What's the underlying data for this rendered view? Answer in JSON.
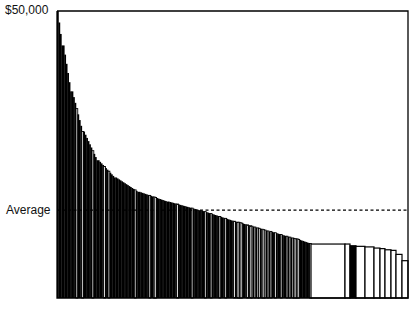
{
  "chart_data": {
    "type": "bar",
    "title": "",
    "xlabel": "",
    "ylabel": "",
    "ylim": [
      0,
      50000
    ],
    "y_tick_labels": [
      "$50,000"
    ],
    "annotations": [
      {
        "label": "Average",
        "value": 15300,
        "style": "dashed-line"
      }
    ],
    "grid": false,
    "legend": null,
    "segments": [
      {
        "from": 50000,
        "to": 44000,
        "count": 4
      },
      {
        "from": 44000,
        "to": 36000,
        "count": 6
      },
      {
        "from": 36000,
        "to": 29000,
        "count": 8
      },
      {
        "from": 29000,
        "to": 24000,
        "count": 10
      },
      {
        "from": 24000,
        "to": 21000,
        "count": 12
      },
      {
        "from": 21000,
        "to": 18500,
        "count": 16
      },
      {
        "from": 18500,
        "to": 16800,
        "count": 20
      },
      {
        "from": 16800,
        "to": 15300,
        "count": 22
      },
      {
        "from": 15300,
        "to": 13200,
        "count": 26
      },
      {
        "from": 13200,
        "to": 11600,
        "count": 22
      },
      {
        "from": 11600,
        "to": 10300,
        "count": 18
      },
      {
        "from": 10300,
        "to": 9500,
        "count": 10
      }
    ],
    "tail_bars": [
      {
        "value": 9400,
        "width": 34,
        "fill": "white"
      },
      {
        "value": 9400,
        "width": 5,
        "fill": "white"
      },
      {
        "value": 9100,
        "width": 6,
        "fill": "black"
      },
      {
        "value": 9000,
        "width": 9,
        "fill": "white"
      },
      {
        "value": 8900,
        "width": 9,
        "fill": "white"
      },
      {
        "value": 8700,
        "width": 6,
        "fill": "white"
      },
      {
        "value": 8600,
        "width": 5,
        "fill": "white"
      },
      {
        "value": 8400,
        "width": 6,
        "fill": "white"
      },
      {
        "value": 8300,
        "width": 5,
        "fill": "white"
      },
      {
        "value": 7600,
        "width": 6,
        "fill": "white"
      },
      {
        "value": 6500,
        "width": 6,
        "fill": "white"
      }
    ]
  },
  "axis": {
    "top_label": "$50,000",
    "average_label": "Average"
  },
  "colors": {
    "bar_fill": "#000000",
    "bar_alt_fill": "#ffffff",
    "frame": "#000000",
    "average_line": "#000000"
  }
}
